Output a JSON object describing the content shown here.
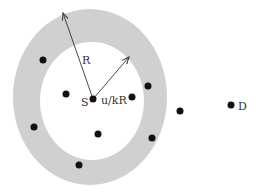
{
  "diagram": {
    "colors": {
      "ring": "#d0d0d0",
      "inner": "#ffffff",
      "node": "#111111",
      "arrow": "#333333"
    },
    "labels": {
      "outer_radius": "R",
      "inner_radius": "u/kR",
      "source": "S",
      "destination": "D"
    },
    "nodes": [
      {
        "id": "n1",
        "region": "ring"
      },
      {
        "id": "n2",
        "region": "inner"
      },
      {
        "id": "S",
        "region": "center",
        "label": "S"
      },
      {
        "id": "n3",
        "region": "inner"
      },
      {
        "id": "n4",
        "region": "ring"
      },
      {
        "id": "n5",
        "region": "ring"
      },
      {
        "id": "n6",
        "region": "inner"
      },
      {
        "id": "n7",
        "region": "ring"
      },
      {
        "id": "n8",
        "region": "ring"
      },
      {
        "id": "n9",
        "region": "outside"
      },
      {
        "id": "D",
        "region": "outside",
        "label": "D"
      }
    ]
  }
}
